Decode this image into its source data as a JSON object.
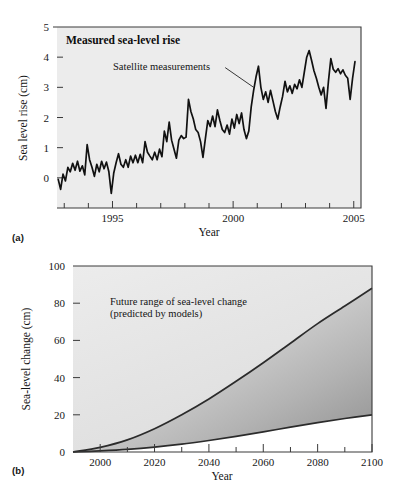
{
  "figure": {
    "panel_a_label": "(a)",
    "panel_b_label": "(b)"
  },
  "chart_data": [
    {
      "panel": "(a)",
      "type": "line",
      "title": "Measured sea-level rise",
      "xlabel": "Year",
      "ylabel": "Sea level rise (cm)",
      "xlim": [
        1992.7,
        2005.3
      ],
      "ylim": [
        -1,
        5
      ],
      "xticks": [
        1995,
        2000,
        2005
      ],
      "xticklabels": [
        "1995",
        "2000",
        "2005"
      ],
      "minor_xticks": [
        1993,
        1994,
        1996,
        1997,
        1998,
        1999,
        2001,
        2002,
        2003,
        2004
      ],
      "yticks": [
        0,
        1,
        2,
        3,
        4,
        5
      ],
      "yticklabels": [
        "0",
        "1",
        "2",
        "3",
        "4",
        "5"
      ],
      "grid": false,
      "legend": "none",
      "annotations": [
        {
          "text": "Satellite measurements",
          "x": 1997.1,
          "y": 3.72,
          "leader_to_x": 2000.85,
          "leader_to_y": 3.0
        }
      ],
      "series": [
        {
          "name": "Satellite measurements",
          "x": [
            1992.75,
            1992.85,
            1992.95,
            1993.05,
            1993.15,
            1993.25,
            1993.35,
            1993.45,
            1993.55,
            1993.65,
            1993.75,
            1993.85,
            1993.95,
            1994.05,
            1994.15,
            1994.25,
            1994.35,
            1994.45,
            1994.55,
            1994.65,
            1994.75,
            1994.85,
            1994.95,
            1995.05,
            1995.15,
            1995.25,
            1995.35,
            1995.45,
            1995.55,
            1995.65,
            1995.75,
            1995.85,
            1995.95,
            1996.05,
            1996.15,
            1996.25,
            1996.35,
            1996.45,
            1996.55,
            1996.65,
            1996.75,
            1996.85,
            1996.95,
            1997.05,
            1997.15,
            1997.25,
            1997.35,
            1997.45,
            1997.55,
            1997.65,
            1997.75,
            1997.85,
            1997.95,
            1998.05,
            1998.15,
            1998.25,
            1998.35,
            1998.45,
            1998.55,
            1998.65,
            1998.75,
            1998.85,
            1998.95,
            1999.05,
            1999.15,
            1999.25,
            1999.35,
            1999.45,
            1999.55,
            1999.65,
            1999.75,
            1999.85,
            1999.95,
            2000.05,
            2000.15,
            2000.25,
            2000.35,
            2000.45,
            2000.55,
            2000.65,
            2000.75,
            2000.85,
            2000.95,
            2001.05,
            2001.15,
            2001.25,
            2001.35,
            2001.45,
            2001.55,
            2001.65,
            2001.75,
            2001.85,
            2001.95,
            2002.05,
            2002.15,
            2002.25,
            2002.35,
            2002.45,
            2002.55,
            2002.65,
            2002.75,
            2002.85,
            2002.95,
            2003.05,
            2003.15,
            2003.25,
            2003.35,
            2003.45,
            2003.55,
            2003.65,
            2003.75,
            2003.85,
            2003.95,
            2004.05,
            2004.15,
            2004.25,
            2004.35,
            2004.45,
            2004.55,
            2004.65,
            2004.75,
            2004.85,
            2004.95,
            2005.05
          ],
          "y": [
            -0.05,
            -0.38,
            0.12,
            -0.1,
            0.35,
            0.2,
            0.48,
            0.25,
            0.55,
            0.22,
            0.4,
            0.1,
            1.1,
            0.6,
            0.35,
            0.05,
            0.45,
            0.2,
            0.55,
            0.3,
            0.52,
            0.2,
            -0.52,
            0.15,
            0.5,
            0.8,
            0.45,
            0.35,
            0.6,
            0.35,
            0.72,
            0.5,
            0.75,
            0.5,
            0.78,
            0.5,
            1.2,
            0.85,
            0.72,
            0.6,
            0.85,
            0.6,
            0.95,
            0.7,
            1.55,
            1.2,
            1.85,
            1.25,
            0.95,
            0.65,
            1.25,
            1.4,
            1.3,
            1.35,
            2.6,
            2.2,
            1.95,
            1.6,
            1.5,
            1.2,
            0.68,
            1.3,
            1.9,
            1.7,
            2.05,
            1.7,
            2.25,
            1.9,
            1.6,
            1.5,
            1.75,
            1.45,
            1.95,
            1.65,
            2.1,
            1.8,
            2.15,
            1.6,
            1.3,
            1.55,
            2.35,
            2.9,
            3.35,
            3.7,
            3.0,
            2.6,
            2.85,
            2.5,
            2.9,
            2.55,
            2.2,
            1.95,
            2.35,
            2.7,
            3.2,
            2.85,
            3.05,
            2.8,
            3.1,
            2.95,
            3.25,
            3.0,
            3.5,
            4.0,
            4.22,
            3.9,
            3.55,
            3.3,
            3.0,
            2.75,
            3.0,
            2.3,
            3.2,
            3.95,
            3.6,
            3.5,
            3.62,
            3.45,
            3.58,
            3.4,
            3.3,
            2.6,
            3.3,
            3.85
          ]
        }
      ]
    },
    {
      "panel": "(b)",
      "type": "area",
      "title": "Future range of sea-level change (predicted by models)",
      "xlabel": "Year",
      "ylabel": "Sea-level change (cm)",
      "xlim": [
        1990,
        2100
      ],
      "ylim": [
        0,
        100
      ],
      "xticks": [
        2000,
        2020,
        2040,
        2060,
        2080,
        2100
      ],
      "xticklabels": [
        "2000",
        "2020",
        "2040",
        "2060",
        "2080",
        "2100"
      ],
      "minor_xticks": [
        1990,
        2010,
        2030,
        2050,
        2070,
        2090
      ],
      "yticks": [
        0,
        20,
        40,
        60,
        80,
        100
      ],
      "yticklabels": [
        "0",
        "20",
        "40",
        "60",
        "80",
        "100"
      ],
      "grid": false,
      "legend": "none",
      "annotations": [
        {
          "text": "Future range of sea-level change",
          "x": 2003,
          "y": 82
        },
        {
          "text": "(predicted by models)",
          "x": 2003,
          "y": 76
        }
      ],
      "series": [
        {
          "name": "upper bound (high model)",
          "x": [
            1990,
            2000,
            2010,
            2020,
            2030,
            2040,
            2050,
            2060,
            2070,
            2080,
            2090,
            2100
          ],
          "y": [
            0,
            2.5,
            6.5,
            12.5,
            20.0,
            28.5,
            38.0,
            48.0,
            58.5,
            69.0,
            78.5,
            88.0
          ]
        },
        {
          "name": "lower bound (low model)",
          "x": [
            1990,
            2000,
            2010,
            2020,
            2030,
            2040,
            2050,
            2060,
            2070,
            2080,
            2090,
            2100
          ],
          "y": [
            0,
            0.6,
            1.4,
            2.6,
            4.2,
            6.2,
            8.4,
            10.8,
            13.4,
            15.8,
            18.0,
            20.0
          ]
        }
      ]
    }
  ]
}
